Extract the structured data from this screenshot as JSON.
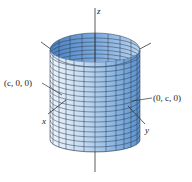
{
  "figure": {
    "type": "3d-surface",
    "colors": {
      "surface_light": "#dbe9f7",
      "surface_mid": "#9cc2e8",
      "surface_dark": "#5f95cf",
      "inner_dark": "#4a7fbf",
      "grid_line": "#2b3a4e",
      "axis": "#333333",
      "background": "#ffffff"
    },
    "axes": {
      "z": {
        "label": "z"
      },
      "x": {
        "label": "x"
      },
      "y": {
        "label": "y"
      }
    },
    "annotations": [
      {
        "id": "x-intercept",
        "text": "(c, 0, 0)"
      },
      {
        "id": "y-intercept",
        "text": "(0, c, 0)"
      }
    ]
  }
}
